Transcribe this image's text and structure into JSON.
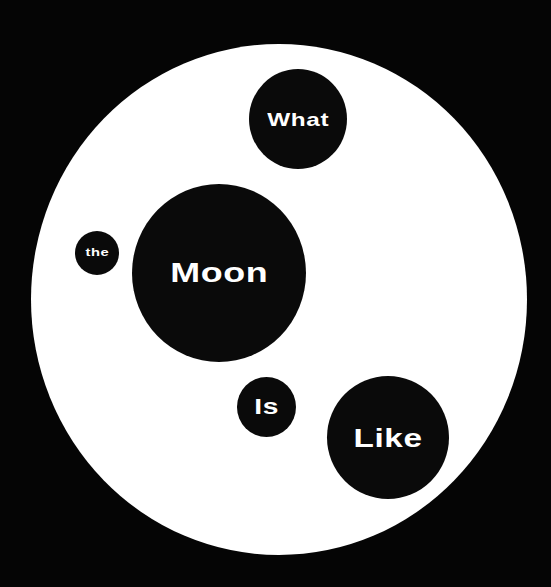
{
  "artwork": {
    "background_color": "#050505",
    "disc_color": "#ffffff",
    "bubble_color": "#0a0a0a",
    "text_color": "#ffffff",
    "words": [
      {
        "id": "what",
        "text": "What"
      },
      {
        "id": "the",
        "text": "the"
      },
      {
        "id": "moon",
        "text": "Moon"
      },
      {
        "id": "is",
        "text": "Is"
      },
      {
        "id": "like",
        "text": "Like"
      }
    ]
  }
}
